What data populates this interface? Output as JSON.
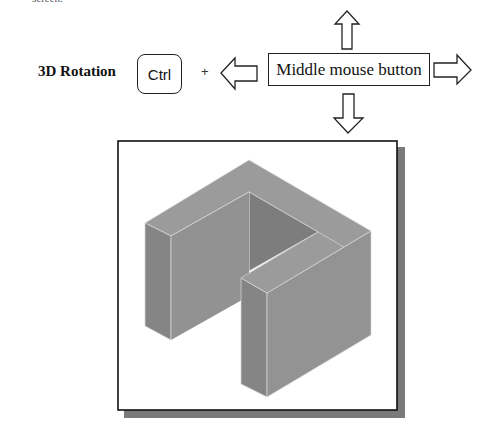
{
  "header": {
    "fragment_text": "screen.",
    "title": "3D Rotation",
    "key_label": "Ctrl",
    "plus": "+",
    "mouse_button_label": "Middle mouse button"
  },
  "arrows": [
    "up-arrow",
    "down-arrow",
    "left-arrow",
    "right-arrow"
  ],
  "viewport": {
    "content": "isometric U-shaped block model",
    "frame_border_color": "#111111",
    "shadow_color": "#777777",
    "face_colors": {
      "top": "#9a9a9a",
      "left": "#858585",
      "front": "#939393",
      "inner": "#7c7c7c"
    }
  }
}
